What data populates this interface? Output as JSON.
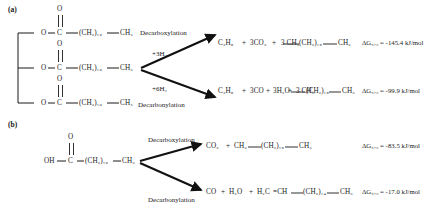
{
  "figure": {
    "type": "reaction-scheme"
  },
  "panels": [
    {
      "id": "a",
      "label": "(a)",
      "reactant": {
        "name": "triglyceride",
        "branches": [
          {
            "o": "O",
            "carbonyl": "C",
            "dbl_o": "O",
            "chain": "(CH₂)₁₆",
            "terminal": "CH₃"
          },
          {
            "o": "O",
            "carbonyl": "C",
            "dbl_o": "O",
            "chain": "(CH₂)₁₆",
            "terminal": "CH₃"
          },
          {
            "o": "O",
            "carbonyl": "C",
            "dbl_o": "O",
            "chain": "(CH₂)₁₆",
            "terminal": "CH₃"
          }
        ]
      },
      "pathways": [
        {
          "name": "decarboxylation",
          "route_label": "Decarboxylation",
          "reagent": "+3H₂",
          "product": "C₃H₈ + 3CO₂ + 3 CH₃—(CH₂)₁₅—CH₃",
          "product_parts": {
            "propane": "C₃H₈",
            "gas": "3CO₂",
            "alkane_head": "3 CH₃",
            "alkane_chain": "(CH₂)₁₅",
            "alkane_tail": "CH₃"
          },
          "delta_g": "ΔG₅₇₃ = -145.4 kJ/mol",
          "delta_g_symbol": "ΔG",
          "delta_g_subscript": "573",
          "delta_g_value": "-145.4",
          "delta_g_unit": "kJ/mol"
        },
        {
          "name": "decarbonylation",
          "route_label": "Decarbonylation",
          "reagent": "+6H₂",
          "product": "C₃H₈ + 3CO + 3H₂O + 3 CH₃—(CH₂)₁₅—CH₃",
          "product_parts": {
            "propane": "C₃H₈",
            "gas": "3CO",
            "water": "3H₂O",
            "alkane_head": "3 CH₃",
            "alkane_chain": "(CH₂)₁₅",
            "alkane_tail": "CH₃"
          },
          "delta_g": "ΔG₅₇₃ = -99.9 kJ/mol",
          "delta_g_symbol": "ΔG",
          "delta_g_subscript": "573",
          "delta_g_value": "-99.9",
          "delta_g_unit": "kJ/mol"
        }
      ]
    },
    {
      "id": "b",
      "label": "(b)",
      "reactant": {
        "name": "fatty-acid",
        "hydroxyl": "OH",
        "carbonyl": "C",
        "dbl_o": "O",
        "chain": "(CH₂)₁₆",
        "terminal": "CH₃"
      },
      "pathways": [
        {
          "name": "decarboxylation",
          "route_label": "Decarboxylation",
          "product": "CO₂ + CH₃—(CH₂)₁₅—CH₃",
          "product_parts": {
            "gas": "CO₂",
            "alkane_head": "CH₃",
            "alkane_chain": "(CH₂)₁₅",
            "alkane_tail": "CH₃"
          },
          "delta_g": "ΔG₅₇₃ = -83.5 kJ/mol",
          "delta_g_symbol": "ΔG",
          "delta_g_subscript": "573",
          "delta_g_value": "-83.5",
          "delta_g_unit": "kJ/mol"
        },
        {
          "name": "decarbonylation",
          "route_label": "Decarbonylation",
          "product": "CO + H₂O + H₂C=CH—(CH₂)₁₄—CH₃",
          "product_parts": {
            "gas": "CO",
            "water": "H₂O",
            "alkene_head": "H₂C",
            "alkene_bond": "=CH",
            "alkene_chain": "(CH₂)₁₄",
            "alkene_tail": "CH₃"
          },
          "delta_g": "ΔG₅₇₃ = -17.0 kJ/mol",
          "delta_g_symbol": "ΔG",
          "delta_g_subscript": "573",
          "delta_g_value": "-17.0",
          "delta_g_unit": "kJ/mol"
        }
      ]
    }
  ],
  "colors": {
    "ink": "#1a1a1a",
    "background": "#ffffff"
  }
}
